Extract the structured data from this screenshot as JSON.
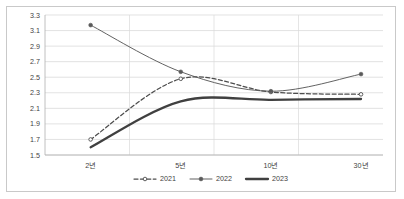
{
  "chart_data": {
    "type": "line",
    "title": "",
    "xlabel": "",
    "ylabel": "",
    "categories": [
      "2년",
      "5년",
      "10년",
      "30년"
    ],
    "series": [
      {
        "name": "2021",
        "values": [
          1.7,
          2.48,
          2.31,
          2.28
        ],
        "style": "dashed",
        "marker": "hollow-circle",
        "color": "#4d4d4d"
      },
      {
        "name": "2022",
        "values": [
          3.17,
          2.57,
          2.32,
          2.54
        ],
        "style": "solid-thin",
        "marker": "filled-circle",
        "color": "#5a5a5a"
      },
      {
        "name": "2023",
        "values": [
          1.6,
          2.19,
          2.21,
          2.22
        ],
        "style": "solid-thick",
        "marker": "none",
        "color": "#404040"
      }
    ],
    "ylim": [
      1.5,
      3.3
    ],
    "ytick_values": [
      1.5,
      1.7,
      1.9,
      2.1,
      2.3,
      2.5,
      2.7,
      2.9,
      3.1,
      3.3
    ],
    "ytick_labels": [
      "1.5",
      "1.7",
      "1.9",
      "2.1",
      "2.3",
      "2.5",
      "2.7",
      "2.9",
      "3.1",
      "3.3"
    ],
    "grid": "horizontal-and-vertical",
    "legend_position": "bottom-center",
    "smoothed": true
  },
  "legend": {
    "items": [
      {
        "label": "2021"
      },
      {
        "label": "2022"
      },
      {
        "label": "2023"
      }
    ]
  }
}
